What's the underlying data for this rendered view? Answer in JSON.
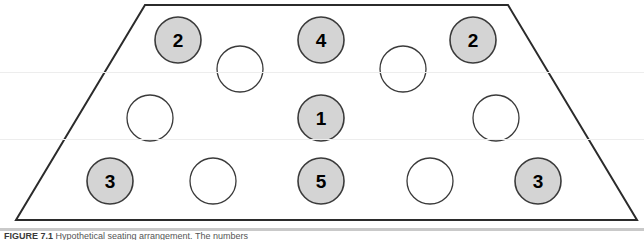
{
  "figure": {
    "caption_label": "FIGURE 7.1",
    "caption_text": "  Hypothetical seating arrangement. The numbers",
    "shape": {
      "name": "trapezoid-room-outline",
      "points": "145,5 508,5 637,220 16,220",
      "stroke": "#2b2b2b",
      "stroke_width": 2,
      "fill": "#ffffff"
    },
    "colors": {
      "filled_circle_fill": "#d4d4d4",
      "filled_circle_stroke": "#3a3a3a",
      "empty_circle_fill": "#ffffff",
      "empty_circle_stroke": "#3a3a3a",
      "number_color": "#000000",
      "background": "#ffffff"
    },
    "geometry": {
      "circle_radius": 23,
      "number_font_size": 19
    }
  },
  "chart_data": {
    "type": "diagram",
    "title": "Hypothetical seating arrangement",
    "rows": [
      {
        "row": "top",
        "seats": [
          {
            "id": "seat-top-1",
            "cx": 178,
            "cy": 40,
            "filled": true,
            "label": "2"
          },
          {
            "id": "seat-top-2",
            "cx": 240,
            "cy": 69,
            "filled": false,
            "label": ""
          },
          {
            "id": "seat-top-3",
            "cx": 321,
            "cy": 40,
            "filled": true,
            "label": "4"
          },
          {
            "id": "seat-top-4",
            "cx": 403,
            "cy": 69,
            "filled": false,
            "label": ""
          },
          {
            "id": "seat-top-5",
            "cx": 473,
            "cy": 40,
            "filled": true,
            "label": "2"
          }
        ]
      },
      {
        "row": "middle",
        "seats": [
          {
            "id": "seat-mid-1",
            "cx": 150,
            "cy": 118,
            "filled": false,
            "label": ""
          },
          {
            "id": "seat-mid-2",
            "cx": 321,
            "cy": 118,
            "filled": true,
            "label": "1"
          },
          {
            "id": "seat-mid-3",
            "cx": 496,
            "cy": 118,
            "filled": false,
            "label": ""
          }
        ]
      },
      {
        "row": "bottom",
        "seats": [
          {
            "id": "seat-bot-1",
            "cx": 110,
            "cy": 181,
            "filled": true,
            "label": "3"
          },
          {
            "id": "seat-bot-2",
            "cx": 213,
            "cy": 181,
            "filled": false,
            "label": ""
          },
          {
            "id": "seat-bot-3",
            "cx": 321,
            "cy": 181,
            "filled": true,
            "label": "5"
          },
          {
            "id": "seat-bot-4",
            "cx": 430,
            "cy": 181,
            "filled": false,
            "label": ""
          },
          {
            "id": "seat-bot-5",
            "cx": 538,
            "cy": 181,
            "filled": true,
            "label": "3"
          }
        ]
      }
    ],
    "labeled_values": [
      "2",
      "4",
      "2",
      "1",
      "3",
      "5",
      "3"
    ],
    "filled_count": 7,
    "empty_count": 8,
    "total_seats": 15
  },
  "artifacts": {
    "scanlines": [
      72,
      139
    ]
  }
}
